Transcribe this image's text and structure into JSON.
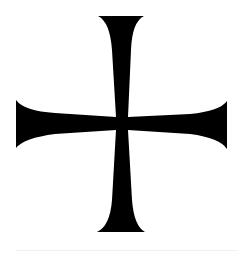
{
  "image": {
    "subject": "cross-pattee",
    "description": "Black flared cross (cross pattée / formée) on white background",
    "colors": {
      "background": "#ffffff",
      "cross": "#000000",
      "footer_line": "#f0f0f0"
    }
  }
}
